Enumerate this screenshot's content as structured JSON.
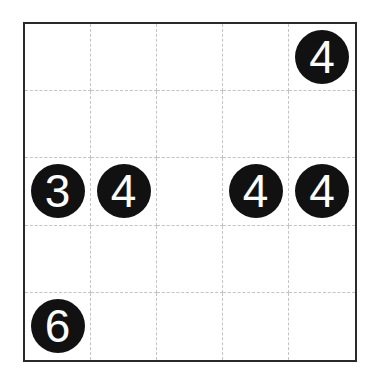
{
  "board": {
    "rows": 5,
    "cols": 5,
    "cells": [
      [
        "",
        "",
        "",
        "",
        "4"
      ],
      [
        "",
        "",
        "",
        "",
        ""
      ],
      [
        "3",
        "4",
        "",
        "4",
        "4"
      ],
      [
        "",
        "",
        "",
        "",
        ""
      ],
      [
        "6",
        "",
        "",
        "",
        ""
      ]
    ]
  },
  "colors": {
    "clue_background": "#111111",
    "clue_text": "#ffffff",
    "grid_border": "#2a2a2a",
    "grid_lines": "#c4c4c4"
  }
}
